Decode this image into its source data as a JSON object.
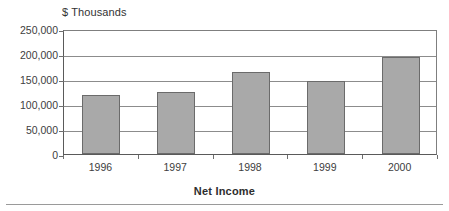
{
  "chart_data": {
    "type": "bar",
    "title": "",
    "unit_caption": "$ Thousands",
    "categories": [
      "1996",
      "1997",
      "1998",
      "1999",
      "2000"
    ],
    "values": [
      120000,
      126000,
      166000,
      148000,
      197000
    ],
    "series": [
      {
        "name": "Net Income",
        "values": [
          120000,
          126000,
          166000,
          148000,
          197000
        ]
      }
    ],
    "xlabel": "Net Income",
    "ylabel": "$ Thousands",
    "ylim": [
      0,
      250000
    ],
    "ytick_values": [
      250000,
      200000,
      150000,
      100000,
      50000,
      0
    ],
    "ytick_labels": [
      "250,000",
      "200,000",
      "150,000",
      "100,000",
      "50,000",
      "0"
    ],
    "xtick_labels": [
      "1996",
      "1997",
      "1998",
      "1999",
      "2000"
    ],
    "grid": "horizontal",
    "legend": "none",
    "bar_color": "#a9a9a9",
    "bar_border_color": "#6b6b6b",
    "gridline_color": "#8c8c8c",
    "axis_color": "#5a5a5a",
    "background_color": "#ffffff",
    "annotations": []
  },
  "figure": {
    "unit_caption": "$ Thousands",
    "axis_title": "Net Income"
  }
}
